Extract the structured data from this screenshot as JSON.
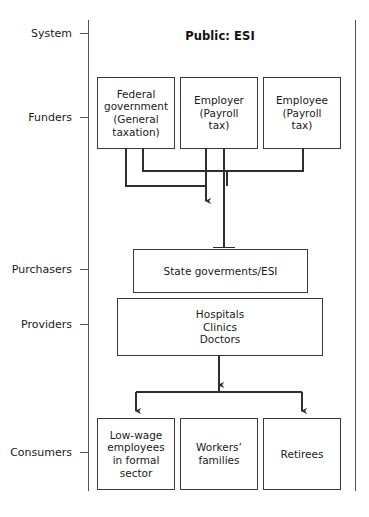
{
  "diagram": {
    "title": "Public: ESI",
    "tiers": [
      {
        "id": "system",
        "label": "System"
      },
      {
        "id": "funders",
        "label": "Funders"
      },
      {
        "id": "purchasers",
        "label": "Purchasers"
      },
      {
        "id": "providers",
        "label": "Providers"
      },
      {
        "id": "consumers",
        "label": "Consumers"
      }
    ],
    "nodes": {
      "federal_government": "Federal\ngovernment\n(General\ntaxation)",
      "employer": "Employer\n(Payroll\ntax)",
      "employee": "Employee\n(Payroll\ntax)",
      "state_governments": "State goverments/ESI",
      "providers": "Hospitals\nClinics\nDoctors",
      "low_wage_employees": "Low-wage\nemployees\nin formal\nsector",
      "workers_families": "Workers’\nfamilies",
      "retirees": "Retirees"
    },
    "colors": {
      "stroke": "#3a3a3a",
      "axis": "#555555",
      "text": "#1a1a1a",
      "background": "#ffffff"
    },
    "flows": [
      {
        "from": "federal_government",
        "to": "funding-pool-arrow",
        "style": "arrow"
      },
      {
        "from": "employer",
        "to": "funding-pool-arrow",
        "style": "arrow"
      },
      {
        "from": "employee",
        "to": "funding-pool-arrow",
        "style": "arrow"
      },
      {
        "from": "employer",
        "to": "state_governments",
        "style": "tee"
      },
      {
        "from": "providers",
        "to": "low_wage_employees",
        "style": "arrow"
      },
      {
        "from": "providers",
        "to": "workers_families",
        "style": "arrow"
      },
      {
        "from": "providers",
        "to": "retirees",
        "style": "arrow"
      }
    ]
  }
}
